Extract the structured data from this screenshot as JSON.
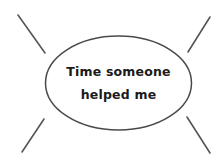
{
  "bubble": {
    "line1": "Time someone",
    "line2": "helped me"
  },
  "colors": {
    "background": "#ffffff",
    "stroke": "#555555",
    "text": "#1a1a1a"
  }
}
